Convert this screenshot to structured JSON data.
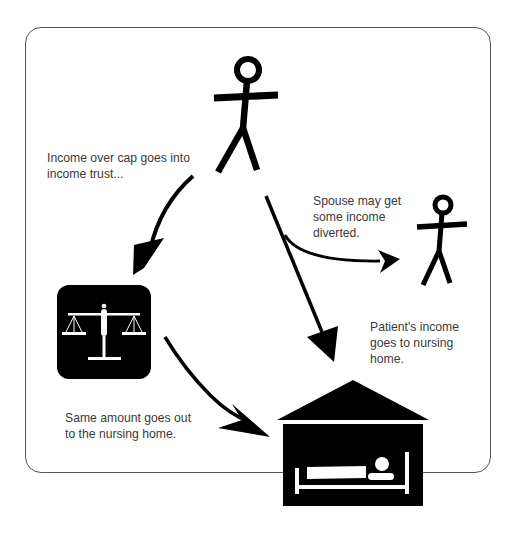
{
  "diagram": {
    "type": "flow-diagram",
    "nodes": [
      {
        "id": "patient",
        "kind": "stick-figure",
        "label": "Patient"
      },
      {
        "id": "spouse",
        "kind": "stick-figure",
        "label": "Spouse"
      },
      {
        "id": "trust",
        "kind": "scales-of-justice-icon",
        "label": "Income trust"
      },
      {
        "id": "nursing_home",
        "kind": "house-with-bed-icon",
        "label": "Nursing home"
      }
    ],
    "edges": [
      {
        "from": "patient",
        "to": "trust",
        "label_ref": "labels.income_over_cap"
      },
      {
        "from": "patient",
        "to": "nursing_home",
        "label_ref": "labels.patient_income"
      },
      {
        "from": "patient",
        "to": "spouse",
        "label_ref": "labels.spouse"
      },
      {
        "from": "trust",
        "to": "nursing_home",
        "label_ref": "labels.same_amount"
      }
    ]
  },
  "labels": {
    "income_over_cap": [
      "Income over cap goes into",
      "income trust..."
    ],
    "spouse": [
      "Spouse may get",
      "some income",
      "diverted."
    ],
    "patient_income": [
      "Patient's income",
      "goes to nursing",
      "home."
    ],
    "same_amount": [
      "Same amount goes out",
      "to the nursing home."
    ]
  },
  "colors": {
    "ink": "#000000",
    "text": "#3a3a3a",
    "frame": "#555555",
    "background": "#ffffff"
  }
}
